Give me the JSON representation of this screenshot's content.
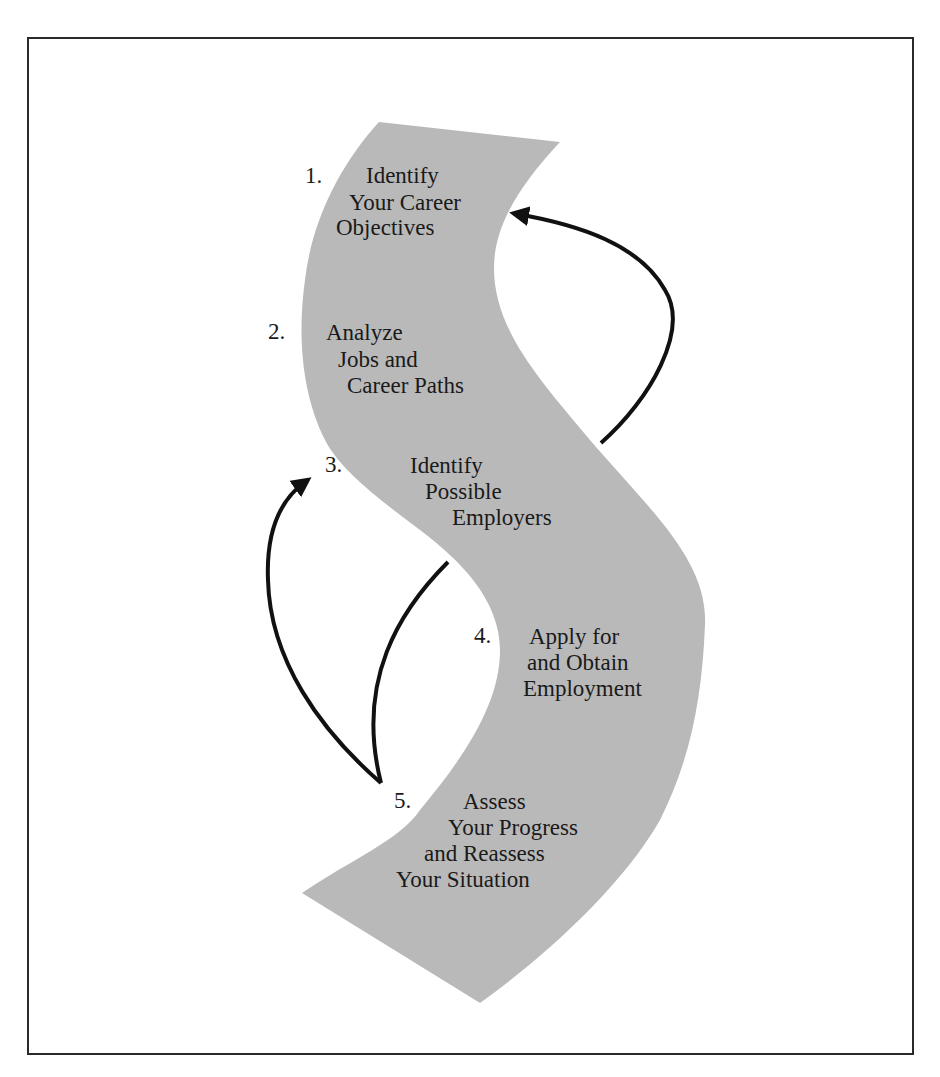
{
  "diagram": {
    "type": "flow-ribbon",
    "colors": {
      "ribbon": "#b9b9b9",
      "ink": "#111111",
      "frame": "#2a2a2a"
    },
    "steps": [
      {
        "number": "1.",
        "lines": [
          "Identify",
          "Your Career",
          "Objectives"
        ]
      },
      {
        "number": "2.",
        "lines": [
          "Analyze",
          "Jobs and",
          "Career Paths"
        ]
      },
      {
        "number": "3.",
        "lines": [
          "Identify",
          "Possible",
          "Employers"
        ]
      },
      {
        "number": "4.",
        "lines": [
          "Apply for",
          "and Obtain",
          "Employment"
        ]
      },
      {
        "number": "5.",
        "lines": [
          "Assess",
          "Your Progress",
          "and Reassess",
          "Your Situation"
        ]
      }
    ],
    "arrows": [
      {
        "from": "step-3",
        "to": "step-1",
        "label": "feedback"
      },
      {
        "from": "step-5",
        "to": "step-3",
        "label": "feedback"
      },
      {
        "from": "step-3",
        "to": "step-5",
        "label": "connector"
      }
    ]
  }
}
